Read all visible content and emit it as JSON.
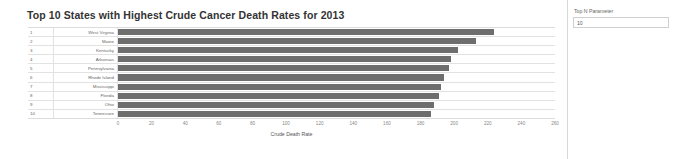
{
  "chart_data": {
    "type": "bar",
    "orientation": "horizontal",
    "title": "Top 10 States with Highest Crude Cancer Death Rates for 2013",
    "xlabel": "Crude Death Rate",
    "ylabel": "",
    "xlim": [
      0,
      260
    ],
    "grid": false,
    "legend": null,
    "xticks": [
      "0",
      "20",
      "40",
      "60",
      "80",
      "100",
      "120",
      "140",
      "160",
      "180",
      "200",
      "220",
      "240",
      "260"
    ],
    "xtick_values": [
      0,
      20,
      40,
      60,
      80,
      100,
      120,
      140,
      160,
      180,
      200,
      220,
      240,
      260
    ],
    "bar_color": "#6e6e6e",
    "ranks": [
      "1",
      "2",
      "3",
      "4",
      "5",
      "6",
      "7",
      "8",
      "9",
      "10"
    ],
    "categories": [
      "West Virginia",
      "Maine",
      "Kentucky",
      "Arkansas",
      "Pennsylvania",
      "Rhode Island",
      "Mississippi",
      "Florida",
      "Ohio",
      "Tennessee"
    ],
    "values": [
      224,
      213,
      202,
      198,
      197,
      194,
      192,
      191,
      188,
      186
    ]
  },
  "parameter_panel": {
    "title": "Top N Parameter",
    "value": "10",
    "placeholder": ""
  }
}
